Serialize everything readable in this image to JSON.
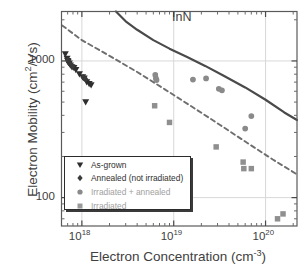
{
  "figure": {
    "inn_label": "InN"
  },
  "chart_data": {
    "type": "scatter",
    "title": "",
    "xlabel_text": "Electron Concentration (cm",
    "xlabel_sup": "-3",
    "xlabel_tail": ")",
    "ylabel_text": "Electron Mobility (cm",
    "ylabel_sup": "2",
    "ylabel_tail": "/Vs)",
    "xscale": "log",
    "yscale": "log",
    "xlim": [
      6e+17,
      2.2e+20
    ],
    "ylim": [
      62,
      2300
    ],
    "xticks": [
      1e+18,
      1e+19,
      1e+20
    ],
    "xtick_labels": [
      "10",
      "10",
      "10"
    ],
    "xtick_exponents": [
      "18",
      "19",
      "20"
    ],
    "yticks": [
      100,
      1000
    ],
    "ytick_labels": [
      "100",
      "1000"
    ],
    "grid": true,
    "legend_position": "lower-left-inside",
    "series": [
      {
        "name": "As-grown",
        "marker": "triangle-down",
        "color": "#2e2e2e",
        "points": [
          [
            6.6e+17,
            1120
          ],
          [
            6.9e+17,
            1040
          ],
          [
            7.1e+17,
            990
          ],
          [
            7.3e+17,
            960
          ],
          [
            7.5e+17,
            930
          ],
          [
            7e+17,
            1000
          ],
          [
            7.8e+17,
            900
          ],
          [
            8.2e+17,
            890
          ],
          [
            8.6e+17,
            860
          ],
          [
            9.4e+17,
            800
          ],
          [
            1.02e+18,
            760
          ],
          [
            1.06e+18,
            745
          ],
          [
            1.13e+18,
            700
          ],
          [
            1.2e+18,
            680
          ],
          [
            1.26e+18,
            665
          ],
          [
            1.1e+18,
            500
          ]
        ]
      },
      {
        "name": "Annealed (not irradiated)",
        "marker": "diamond",
        "color": "#3a3a3a",
        "points": [
          [
            7e+17,
            1010
          ],
          [
            7.2e+17,
            975
          ],
          [
            7.4e+17,
            955
          ],
          [
            7.6e+17,
            935
          ],
          [
            7.9e+17,
            915
          ],
          [
            1.04e+18,
            755
          ],
          [
            1.1e+18,
            735
          ]
        ]
      },
      {
        "name": "Irradiated + annealed",
        "marker": "circle",
        "color": "#8a8a8a",
        "points": [
          [
            6.3e+18,
            790
          ],
          [
            6.4e+18,
            745
          ],
          [
            6.5e+18,
            725
          ],
          [
            1.62e+19,
            730
          ],
          [
            2.25e+19,
            745
          ],
          [
            3.1e+19,
            625
          ],
          [
            3.35e+19,
            610
          ],
          [
            6e+19,
            320
          ],
          [
            7e+19,
            395
          ]
        ]
      },
      {
        "name": "Irradiated",
        "marker": "square",
        "color": "#8f8f8f",
        "points": [
          [
            6.2e+18,
            470
          ],
          [
            9e+18,
            355
          ],
          [
            2.9e+19,
            235
          ],
          [
            5.7e+19,
            182
          ],
          [
            5.8e+19,
            163
          ],
          [
            7e+19,
            163
          ],
          [
            1.35e+20,
            70
          ],
          [
            1.55e+20,
            76
          ]
        ]
      }
    ],
    "curves": [
      {
        "name": "InN theoretical limit",
        "style": "solid",
        "color": "#4a4a4a",
        "points": [
          [
            2.35e+18,
            2300
          ],
          [
            3e+18,
            1950
          ],
          [
            4e+18,
            1690
          ],
          [
            6e+18,
            1420
          ],
          [
            9e+18,
            1230
          ],
          [
            1.4e+19,
            1070
          ],
          [
            2.2e+19,
            920
          ],
          [
            3.5e+19,
            780
          ],
          [
            6e+19,
            640
          ],
          [
            1e+20,
            520
          ],
          [
            1.6e+20,
            420
          ],
          [
            2.2e+20,
            370
          ]
        ]
      },
      {
        "name": "lower trend",
        "style": "dashed",
        "color": "#6e6e6e",
        "points": [
          [
            6.1e+17,
            1820
          ],
          [
            1e+18,
            1420
          ],
          [
            2e+18,
            1090
          ],
          [
            4e+18,
            830
          ],
          [
            8e+18,
            620
          ],
          [
            1.6e+19,
            460
          ],
          [
            3.2e+19,
            340
          ],
          [
            6.4e+19,
            250
          ],
          [
            1.2e+20,
            190
          ],
          [
            2.2e+20,
            148
          ]
        ]
      }
    ],
    "legend_entries": [
      {
        "label": "As-grown",
        "marker": "triangle-down",
        "color": "#2e2e2e"
      },
      {
        "label": "Annealed (not irradiated)",
        "marker": "diamond",
        "color": "#3a3a3a"
      },
      {
        "label": "Irradiated + annealed",
        "marker": "circle",
        "color": "#8a8a8a"
      },
      {
        "label": "Irradiated",
        "marker": "square",
        "color": "#9a9a9a"
      }
    ]
  }
}
